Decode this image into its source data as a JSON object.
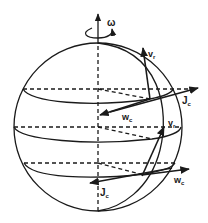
{
  "figure": {
    "colors": {
      "ink": "#1a1a1a",
      "background": "#ffffff"
    },
    "labels": {
      "omega": "ω",
      "vr_top": "v",
      "vr_top_sub": "r",
      "jc_top": "J",
      "jc_top_sub": "c",
      "wc_top": "w",
      "wc_top_sub": "c",
      "vr_mid": "v",
      "vr_mid_sub": "r",
      "wc_bottom": "w",
      "wc_bottom_sub": "c",
      "jc_bottom": "J",
      "jc_bottom_sub": "c"
    }
  }
}
